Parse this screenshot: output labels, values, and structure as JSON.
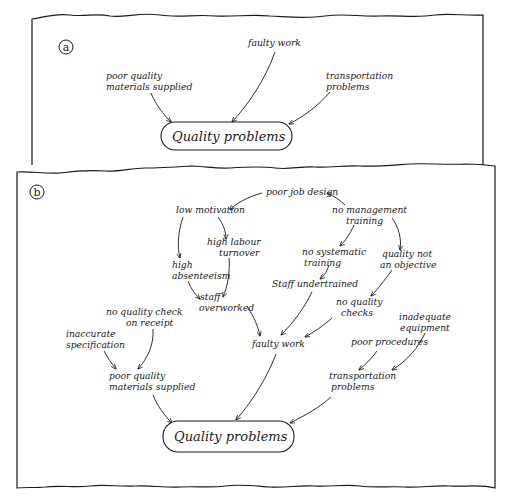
{
  "panels": [
    {
      "id": "a",
      "tag": "a",
      "frame": {
        "x": 32,
        "y": 15,
        "w": 451,
        "h": 150
      },
      "tag_pos": {
        "x": 62,
        "y": 48
      },
      "target": {
        "label": "Quality problems",
        "x": 161,
        "y": 122,
        "w": 131,
        "h": 28
      },
      "nodes": [
        {
          "id": "faulty_work",
          "lines": [
            "faulty work"
          ],
          "x": 248,
          "y": 46,
          "anchor": "start"
        },
        {
          "id": "poor_materials",
          "lines": [
            "poor quality",
            "materials supplied"
          ],
          "x": 106,
          "y": 79,
          "anchor": "start"
        },
        {
          "id": "transport",
          "lines": [
            "transportation",
            "problems"
          ],
          "x": 326,
          "y": 79,
          "anchor": "start"
        }
      ],
      "edges": [
        {
          "from": "faulty_work",
          "to": "target",
          "path": "M275,52 C265,80 248,105 232,122"
        },
        {
          "from": "poor_materials",
          "to": "target",
          "path": "M151,93 C156,105 163,114 171,122"
        },
        {
          "from": "transport",
          "to": "target",
          "path": "M330,92 C318,106 303,117 289,124"
        }
      ]
    },
    {
      "id": "b",
      "tag": "b",
      "frame": {
        "x": 17,
        "y": 170,
        "w": 478,
        "h": 318
      },
      "tag_pos": {
        "x": 37,
        "y": 192
      },
      "target": {
        "label": "Quality problems",
        "x": 163,
        "y": 421,
        "w": 131,
        "h": 31
      },
      "nodes": [
        {
          "id": "poor_job_design",
          "lines": [
            "poor job design"
          ],
          "x": 266,
          "y": 195,
          "anchor": "start"
        },
        {
          "id": "low_motivation",
          "lines": [
            "low motivation"
          ],
          "x": 176,
          "y": 213,
          "anchor": "start"
        },
        {
          "id": "no_mgmt_training",
          "lines": [
            "no management",
            "training"
          ],
          "x": 332,
          "y": 213,
          "anchor": "start",
          "align": [
            0,
            14
          ]
        },
        {
          "id": "high_labour_turnover",
          "lines": [
            "high labour",
            "turnover"
          ],
          "x": 207,
          "y": 245,
          "anchor": "start",
          "align": [
            0,
            12
          ]
        },
        {
          "id": "no_systematic_training",
          "lines": [
            "no systematic",
            "training"
          ],
          "x": 302,
          "y": 255,
          "anchor": "start",
          "align": [
            0,
            2
          ]
        },
        {
          "id": "quality_not_objective",
          "lines": [
            "quality not",
            "an objective"
          ],
          "x": 382,
          "y": 257,
          "anchor": "start",
          "align": [
            0,
            -2
          ]
        },
        {
          "id": "high_absenteeism",
          "lines": [
            "high",
            "absenteeism"
          ],
          "x": 172,
          "y": 268,
          "anchor": "start"
        },
        {
          "id": "staff_undertrained",
          "lines": [
            "Staff undertrained"
          ],
          "x": 272,
          "y": 287,
          "anchor": "start"
        },
        {
          "id": "staff_overworked",
          "lines": [
            "staff",
            "overworked"
          ],
          "x": 200,
          "y": 300,
          "anchor": "start",
          "align": [
            0,
            -1
          ]
        },
        {
          "id": "no_quality_checks",
          "lines": [
            "no quality",
            "checks"
          ],
          "x": 336,
          "y": 305,
          "anchor": "start",
          "align": [
            0,
            5
          ]
        },
        {
          "id": "no_quality_check_receipt",
          "lines": [
            "no quality check",
            "on receipt"
          ],
          "x": 106,
          "y": 315,
          "anchor": "start",
          "align": [
            0,
            20
          ]
        },
        {
          "id": "inadequate_equipment",
          "lines": [
            "inadequate",
            "equipment"
          ],
          "x": 399,
          "y": 320,
          "anchor": "start",
          "align": [
            0,
            1
          ]
        },
        {
          "id": "inaccurate_specification",
          "lines": [
            "inaccurate",
            "specification"
          ],
          "x": 66,
          "y": 337,
          "anchor": "start"
        },
        {
          "id": "faulty_work_b",
          "lines": [
            "faulty work"
          ],
          "x": 252,
          "y": 347,
          "anchor": "start"
        },
        {
          "id": "poor_procedures",
          "lines": [
            "poor procedures"
          ],
          "x": 351,
          "y": 345,
          "anchor": "start"
        },
        {
          "id": "poor_materials_b",
          "lines": [
            "poor quality",
            "materials supplied"
          ],
          "x": 109,
          "y": 379,
          "anchor": "start"
        },
        {
          "id": "transport_b",
          "lines": [
            "transportation",
            "problems"
          ],
          "x": 329,
          "y": 379,
          "anchor": "start",
          "align": [
            0,
            2
          ]
        }
      ],
      "edges": [
        {
          "from": "poor_job_design",
          "to": "low_motivation",
          "path": "M262,193 C248,197 236,203 230,210"
        },
        {
          "from": "no_mgmt_training",
          "to": "poor_job_design",
          "path": "M345,205 C340,200 334,196 327,193"
        },
        {
          "from": "low_motivation",
          "to": "high_absenteeism",
          "path": "M183,217 C178,232 177,247 180,258"
        },
        {
          "from": "low_motivation",
          "to": "high_labour_turnover",
          "path": "M218,217 C223,224 226,231 226,239"
        },
        {
          "from": "high_labour_turnover",
          "to": "staff_overworked",
          "path": "M229,258 C230,272 228,285 223,297"
        },
        {
          "from": "high_absenteeism",
          "to": "staff_overworked",
          "path": "M188,281 C191,289 195,294 200,299"
        },
        {
          "from": "no_mgmt_training",
          "to": "no_systematic_training",
          "path": "M354,225 C350,234 346,240 340,246"
        },
        {
          "from": "no_mgmt_training",
          "to": "quality_not_objective",
          "path": "M392,218 C398,226 402,238 400,250"
        },
        {
          "from": "no_systematic_training",
          "to": "staff_undertrained",
          "path": "M329,265 C327,271 325,275 320,279"
        },
        {
          "from": "quality_not_objective",
          "to": "no_quality_checks",
          "path": "M392,270 C384,281 377,290 371,296"
        },
        {
          "from": "staff_overworked",
          "to": "faulty_work_b",
          "path": "M248,308 C254,317 258,326 260,336"
        },
        {
          "from": "staff_undertrained",
          "to": "faulty_work_b",
          "path": "M312,292 C304,308 294,322 281,335"
        },
        {
          "from": "no_quality_checks",
          "to": "faulty_work_b",
          "path": "M332,318 C323,326 314,332 305,337"
        },
        {
          "from": "no_quality_check_receipt",
          "to": "poor_materials_b",
          "path": "M153,329 C154,344 148,358 138,369"
        },
        {
          "from": "inaccurate_specification",
          "to": "poor_materials_b",
          "path": "M104,351 C108,358 111,363 116,369"
        },
        {
          "from": "poor_procedures",
          "to": "transport_b",
          "path": "M377,351 C372,358 366,364 359,370"
        },
        {
          "from": "inadequate_equipment",
          "to": "transport_b",
          "path": "M425,333 C418,348 408,360 392,370"
        },
        {
          "from": "poor_materials_b",
          "to": "target",
          "path": "M153,395 C158,407 164,415 172,423"
        },
        {
          "from": "faulty_work_b",
          "to": "target",
          "path": "M276,354 C268,375 255,398 236,420"
        },
        {
          "from": "transport_b",
          "to": "target",
          "path": "M331,397 C320,407 306,415 290,423"
        }
      ]
    }
  ]
}
